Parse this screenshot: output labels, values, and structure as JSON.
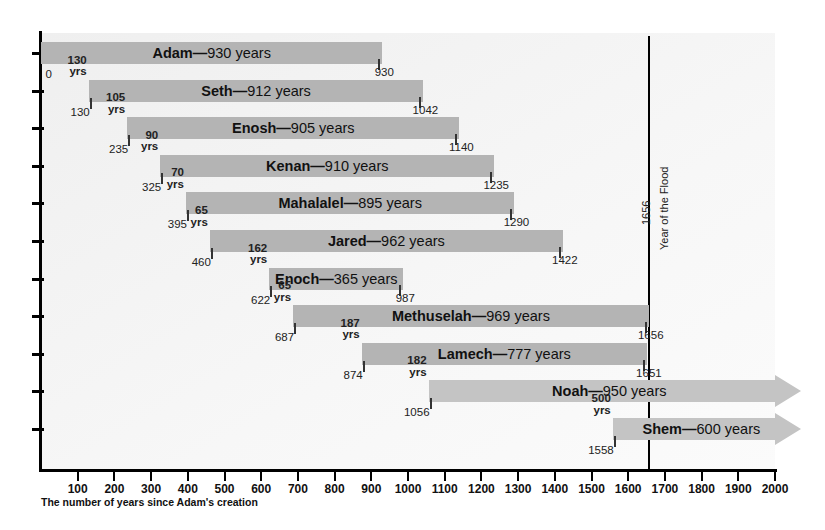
{
  "chart_data": {
    "type": "bar",
    "xlabel": "The number of years since Adam's creation",
    "ylabel": "",
    "xlim": [
      0,
      2000
    ],
    "xticks": [
      100,
      200,
      300,
      400,
      500,
      600,
      700,
      800,
      900,
      1000,
      1100,
      1200,
      1300,
      1400,
      1500,
      1600,
      1700,
      1800,
      1900,
      2000
    ],
    "grid": false,
    "legend": null,
    "categories": [
      "Adam",
      "Seth",
      "Enosh",
      "Kenan",
      "Mahalalel",
      "Jared",
      "Enoch",
      "Methuselah",
      "Lamech",
      "Noah",
      "Shem"
    ],
    "values": [
      930,
      912,
      905,
      910,
      895,
      962,
      365,
      969,
      777,
      950,
      600
    ],
    "series": [
      {
        "name": "lifespan",
        "bars": [
          {
            "name": "Adam",
            "lifespan": 930,
            "start": 0,
            "end": 930,
            "label": "Adam",
            "dash": "—",
            "suffix": "930 years",
            "start_label": "0",
            "end_label": "930",
            "gap_value": null,
            "gap_unit": null,
            "open_ended": false
          },
          {
            "name": "Seth",
            "lifespan": 912,
            "start": 130,
            "end": 1042,
            "label": "Seth",
            "dash": "—",
            "suffix": "912 years",
            "start_label": "130",
            "end_label": "1042",
            "gap_value": "130",
            "gap_unit": "yrs",
            "open_ended": false
          },
          {
            "name": "Enosh",
            "lifespan": 905,
            "start": 235,
            "end": 1140,
            "label": "Enosh",
            "dash": "—",
            "suffix": "905 years",
            "start_label": "235",
            "end_label": "1140",
            "gap_value": "105",
            "gap_unit": "yrs",
            "open_ended": false
          },
          {
            "name": "Kenan",
            "lifespan": 910,
            "start": 325,
            "end": 1235,
            "label": "Kenan",
            "dash": "—",
            "suffix": "910 years",
            "start_label": "325",
            "end_label": "1235",
            "gap_value": "90",
            "gap_unit": "yrs",
            "open_ended": false
          },
          {
            "name": "Mahalalel",
            "lifespan": 895,
            "start": 395,
            "end": 1290,
            "label": "Mahalalel",
            "dash": "—",
            "suffix": "895 years",
            "start_label": "395",
            "end_label": "1290",
            "gap_value": "70",
            "gap_unit": "yrs",
            "open_ended": false
          },
          {
            "name": "Jared",
            "lifespan": 962,
            "start": 460,
            "end": 1422,
            "label": "Jared",
            "dash": "—",
            "suffix": "962 years",
            "start_label": "460",
            "end_label": "1422",
            "gap_value": "65",
            "gap_unit": "yrs",
            "open_ended": false
          },
          {
            "name": "Enoch",
            "lifespan": 365,
            "start": 622,
            "end": 987,
            "label": "Enoch",
            "dash": "—",
            "suffix": "365 years",
            "start_label": "622",
            "end_label": "987",
            "gap_value": "162",
            "gap_unit": "yrs",
            "open_ended": false
          },
          {
            "name": "Methuselah",
            "lifespan": 969,
            "start": 687,
            "end": 1656,
            "label": "Methuselah",
            "dash": "—",
            "suffix": "969 years",
            "start_label": "687",
            "end_label": "1656",
            "gap_value": "65",
            "gap_unit": "yrs",
            "open_ended": false
          },
          {
            "name": "Lamech",
            "lifespan": 777,
            "start": 874,
            "end": 1651,
            "label": "Lamech",
            "dash": "—",
            "suffix": "777 years",
            "start_label": "874",
            "end_label": "1651",
            "gap_value": "187",
            "gap_unit": "yrs",
            "open_ended": false
          },
          {
            "name": "Noah",
            "lifespan": 950,
            "start": 1056,
            "end": 2006,
            "label": "Noah",
            "dash": "—",
            "suffix": "950 years",
            "start_label": "1056",
            "end_label": "",
            "gap_value": "182",
            "gap_unit": "yrs",
            "open_ended": true
          },
          {
            "name": "Shem",
            "lifespan": 600,
            "start": 1558,
            "end": 2158,
            "label": "Shem",
            "dash": "—",
            "suffix": "600 years",
            "start_label": "1558",
            "end_label": "",
            "gap_value": "500",
            "gap_unit": "yrs",
            "open_ended": true
          }
        ]
      }
    ],
    "annotations": [
      {
        "name": "flood-line",
        "x": 1656,
        "year_label": "1656",
        "text": "Year of the Flood"
      }
    ],
    "colors": {
      "bar": "#b4b4b4",
      "bar_light": "#c4c4c4",
      "axis": "#000000",
      "text": "#111111",
      "plot_background": "#f4f4f4"
    }
  },
  "axis": {
    "caption": "The number of years since Adam's creation",
    "ticks": [
      "100",
      "200",
      "300",
      "400",
      "500",
      "600",
      "700",
      "800",
      "900",
      "1000",
      "1100",
      "1200",
      "1300",
      "1400",
      "1500",
      "1600",
      "1700",
      "1800",
      "1900",
      "2000"
    ]
  },
  "flood": {
    "year": "1656",
    "label": "Year of the Flood"
  }
}
